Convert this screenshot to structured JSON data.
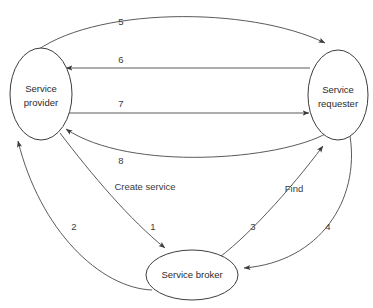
{
  "diagram": {
    "background_color": "#ffffff",
    "node_stroke_color": "#3d3d3d",
    "edge_stroke_color": "#5a5a5a",
    "text_color": "#2b2b2b",
    "nodes": [
      {
        "id": "service-provider",
        "label_line1": "Service",
        "label_line2": "provider",
        "cx": 41,
        "cy": 94,
        "rx": 31,
        "ry": 46
      },
      {
        "id": "service-requester",
        "label_line1": "Service",
        "label_line2": "requester",
        "cx": 338,
        "cy": 95,
        "rx": 30,
        "ry": 45
      },
      {
        "id": "service-broker",
        "label_line1": "Service broker",
        "label_line2": "",
        "cx": 192,
        "cy": 275,
        "rx": 46,
        "ry": 25
      }
    ],
    "edges": [
      {
        "id": "edge-5",
        "label": "5",
        "label_x": 121,
        "label_y": 22,
        "from": "service-provider",
        "to": "service-requester",
        "shape": "arc-over-top"
      },
      {
        "id": "edge-6",
        "label": "6",
        "label_x": 121,
        "label_y": 60,
        "from": "service-requester",
        "to": "service-provider",
        "shape": "straight-left"
      },
      {
        "id": "edge-7",
        "label": "7",
        "label_x": 121,
        "label_y": 104,
        "from": "service-provider",
        "to": "service-requester",
        "shape": "straight-right"
      },
      {
        "id": "edge-8",
        "label": "8",
        "label_x": 121,
        "label_y": 161,
        "from": "service-requester",
        "to": "service-provider",
        "shape": "arc-under"
      },
      {
        "id": "edge-1",
        "label": "1",
        "label_x": 153,
        "label_y": 227,
        "from": "service-provider",
        "to": "service-broker",
        "shape": "curve-down-right"
      },
      {
        "id": "edge-2",
        "label": "2",
        "label_x": 74,
        "label_y": 227,
        "from": "service-broker",
        "to": "service-provider",
        "shape": "curve-up-left"
      },
      {
        "id": "edge-3",
        "label": "3",
        "label_x": 253,
        "label_y": 227,
        "from": "service-broker",
        "to": "service-requester",
        "shape": "curve-up-right"
      },
      {
        "id": "edge-4",
        "label": "4",
        "label_x": 328,
        "label_y": 227,
        "from": "service-requester",
        "to": "service-broker",
        "shape": "curve-down-left"
      }
    ],
    "annotations": [
      {
        "id": "create-service",
        "text": "Create service",
        "x": 145,
        "y": 187
      },
      {
        "id": "find",
        "text": "Find",
        "x": 294,
        "y": 189
      }
    ]
  }
}
